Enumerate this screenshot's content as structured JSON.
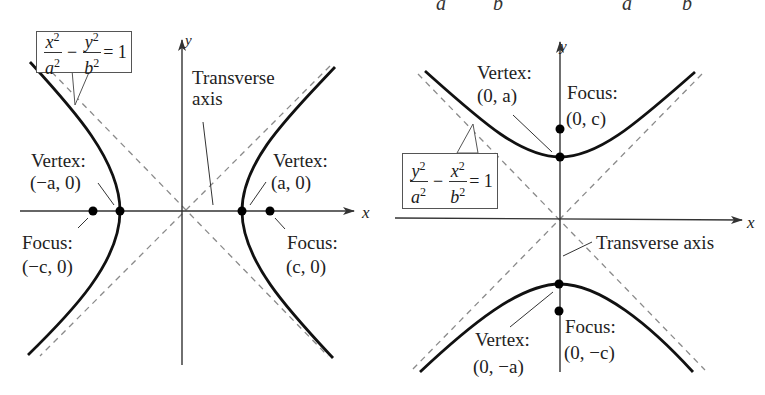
{
  "top_fragment": {
    "glyphs": [
      "a",
      "b",
      "a",
      "b"
    ]
  },
  "left_diagram": {
    "title": "Horizontal transverse axis hyperbola",
    "equation": {
      "num1": "x",
      "den1": "a",
      "num2": "y",
      "den2": "b",
      "exp": "2",
      "minus": "−",
      "equals": "= 1"
    },
    "axis_labels": {
      "x": "x",
      "y": "y"
    },
    "transverse_axis_label": [
      "Transverse",
      "axis"
    ],
    "left_vertex": {
      "title": "Vertex:",
      "coords": "(−a, 0)"
    },
    "right_vertex": {
      "title": "Vertex:",
      "coords": "(a, 0)"
    },
    "left_focus": {
      "title": "Focus:",
      "coords": "(−c, 0)"
    },
    "right_focus": {
      "title": "Focus:",
      "coords": "(c, 0)"
    }
  },
  "right_diagram": {
    "title": "Vertical transverse axis hyperbola",
    "equation": {
      "num1": "y",
      "den1": "a",
      "num2": "x",
      "den2": "b",
      "exp": "2",
      "minus": "−",
      "equals": "= 1"
    },
    "axis_labels": {
      "x": "x",
      "y": "y"
    },
    "transverse_axis_label": "Transverse axis",
    "upper_vertex": {
      "title": "Vertex:",
      "coords": "(0, a)"
    },
    "lower_vertex": {
      "title": "Vertex:",
      "coords": "(0, −a)"
    },
    "upper_focus": {
      "title": "Focus:",
      "coords": "(0, c)"
    },
    "lower_focus": {
      "title": "Focus:",
      "coords": "(0, −c)"
    }
  },
  "colors": {
    "curve": "#111111",
    "axis": "#333333",
    "asymptote": "#8a8a8a",
    "point": "#000000"
  }
}
